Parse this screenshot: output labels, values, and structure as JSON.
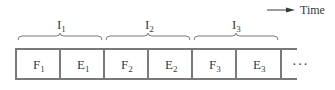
{
  "legend": {
    "label": "Time",
    "arrow": "right-arrow"
  },
  "instructions": [
    {
      "label": "I",
      "sub": "1"
    },
    {
      "label": "I",
      "sub": "2"
    },
    {
      "label": "I",
      "sub": "3"
    }
  ],
  "cells": [
    {
      "label": "F",
      "sub": "1"
    },
    {
      "label": "E",
      "sub": "1"
    },
    {
      "label": "F",
      "sub": "2"
    },
    {
      "label": "E",
      "sub": "2"
    },
    {
      "label": "F",
      "sub": "3"
    },
    {
      "label": "E",
      "sub": "3"
    }
  ],
  "continuation": "···",
  "colors": {
    "line": "#7a7a7a",
    "text": "#3a3a3a"
  }
}
